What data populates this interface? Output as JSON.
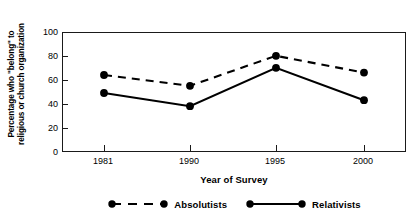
{
  "chart_data": {
    "type": "line",
    "title": "",
    "xlabel": "Year of Survey",
    "ylabel_lines": [
      "Percentage who \"belong\" to",
      "religious or church organization"
    ],
    "ylabel": "Percentage who \"belong\" to religious or church organization",
    "categories": [
      "1981",
      "1990",
      "1995",
      "2000"
    ],
    "ytick_labels": [
      "100",
      "80",
      "60",
      "40",
      "20",
      "0"
    ],
    "ytick_values": [
      100,
      80,
      60,
      40,
      20,
      0
    ],
    "ylim": [
      0,
      100
    ],
    "grid": false,
    "legend_position": "below-axes",
    "series": [
      {
        "name": "Absolutists",
        "style": "dashed",
        "marker": "circle",
        "color": "#000000",
        "values": [
          65,
          56,
          81,
          67
        ]
      },
      {
        "name": "Relativists",
        "style": "solid",
        "marker": "circle",
        "color": "#000000",
        "values": [
          50,
          39,
          71,
          44
        ]
      }
    ]
  },
  "axis": {
    "frame_color": "#1a1a1a"
  }
}
